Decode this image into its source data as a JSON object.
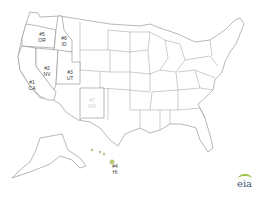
{
  "map": {
    "title": "",
    "ranked_states": [
      {
        "rank": "#1",
        "abbr": "CA",
        "color": "#6fa8dc"
      },
      {
        "rank": "#2",
        "abbr": "NV",
        "color": "#c98a4e"
      },
      {
        "rank": "#3",
        "abbr": "UT",
        "color": "#a84a4e"
      },
      {
        "rank": "#4",
        "abbr": "HI",
        "color": "#c9d36a"
      },
      {
        "rank": "#5",
        "abbr": "OR",
        "color": "#f5d35c"
      },
      {
        "rank": "#6",
        "abbr": "ID",
        "color": "#a9c95a"
      },
      {
        "rank": "#7",
        "abbr": "NM",
        "color": "#4a4c44"
      }
    ]
  },
  "labels": {
    "or_rank": "#5",
    "or_abbr": "OR",
    "id_rank": "#6",
    "id_abbr": "ID",
    "nv_rank": "#2",
    "nv_abbr": "NV",
    "ut_rank": "#3",
    "ut_abbr": "UT",
    "ca_rank": "#1",
    "ca_abbr": "CA",
    "nm_rank": "#7",
    "nm_abbr": "NM",
    "hi_rank": "#4",
    "hi_abbr": "HI"
  },
  "logo": {
    "text": "eia"
  }
}
